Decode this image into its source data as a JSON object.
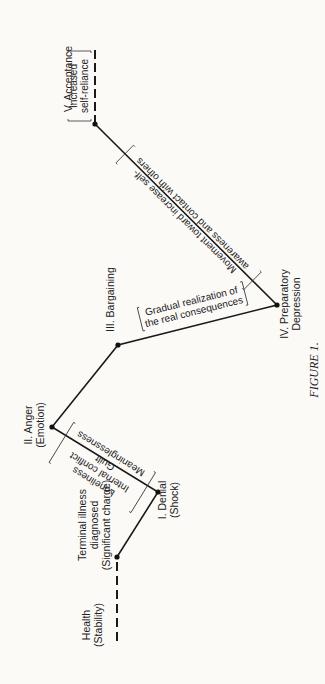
{
  "figure": {
    "caption": "FIGURE 1.",
    "colors": {
      "line": "#1a1a1a",
      "background": "#fbfaf7"
    },
    "stages": [
      {
        "id": "health",
        "lines": [
          "Health",
          "(Stability)"
        ]
      },
      {
        "id": "terminal",
        "lines": [
          "Terminal illness",
          "diagnosed",
          "(Significant charge)"
        ]
      },
      {
        "id": "denial",
        "lines": [
          "I. Denial",
          "(Shock)"
        ]
      },
      {
        "id": "anger",
        "lines": [
          "II. Anger",
          "(Emotion)"
        ]
      },
      {
        "id": "bargaining",
        "lines": [
          "III. Bargaining"
        ]
      },
      {
        "id": "depression",
        "lines": [
          "IV. Preparatory",
          "Depression"
        ]
      },
      {
        "id": "acceptance",
        "lines": [
          "V. Acceptance"
        ]
      }
    ],
    "annotations": {
      "denial_to_anger": [
        "Loneliness",
        "Internal conflict",
        "Guilt",
        "Meaninglessness"
      ],
      "bargaining_to_depression": [
        "Gradual realization of",
        "the real consequences"
      ],
      "depression_to_acceptance": [
        "Movement toward increase self-",
        "awareness and contact with others"
      ],
      "acceptance_end": [
        "Increased",
        "self-reliance"
      ]
    }
  }
}
